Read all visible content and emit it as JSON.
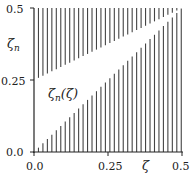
{
  "chart_data": {
    "type": "area",
    "title": "",
    "xlabel": "ζ",
    "ylabel": "ζn",
    "xlim": [
      0.0,
      0.5
    ],
    "ylim": [
      0.0,
      0.5
    ],
    "x_ticks": [
      "0.0",
      "0.25",
      "0.5"
    ],
    "y_ticks": [
      "0.0",
      "0.25",
      "0.5"
    ],
    "grid": false,
    "legend": null,
    "regions": [
      {
        "name": "hatched-upper",
        "description": "Hatched (vertical lines) region above the upper boundary",
        "boundary": {
          "x": [
            0.0,
            0.5
          ],
          "y": [
            0.25,
            0.5
          ]
        },
        "fill": "vertical-hatch"
      },
      {
        "name": "allowed-wedge",
        "description": "White wedge between lower and upper boundaries",
        "upper_boundary": {
          "x": [
            0.0,
            0.5
          ],
          "y": [
            0.25,
            0.5
          ]
        },
        "lower_boundary": {
          "x": [
            0.0,
            0.5
          ],
          "y": [
            0.0,
            0.5
          ]
        },
        "fill": "none"
      },
      {
        "name": "hatched-lower",
        "description": "Hatched (vertical lines) region below the diagonal ζn = ζ",
        "boundary": {
          "x": [
            0.0,
            0.5
          ],
          "y": [
            0.0,
            0.5
          ]
        },
        "fill": "vertical-hatch"
      }
    ],
    "annotations": [
      {
        "text": "ζn(ζ)",
        "x": 0.1,
        "y": 0.2
      }
    ],
    "hatch_line_count": 33
  },
  "labels": {
    "ylabel_main": "ζ",
    "ylabel_sub": "n",
    "xlabel": "ζ",
    "annotation_main": "ζ",
    "annotation_sub": "n",
    "annotation_arg": "(ζ)",
    "x_tick_0": "0.0",
    "x_tick_1": "0.25",
    "x_tick_2": "0.5",
    "y_tick_0": "0.0",
    "y_tick_1": "0.25",
    "y_tick_2": "0.5"
  },
  "colors": {
    "hatch": "#444444",
    "axis": "#222222",
    "background": "#ffffff"
  }
}
